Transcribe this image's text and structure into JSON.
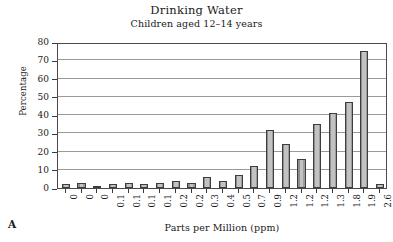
{
  "panel": {
    "label": "A"
  },
  "chart_data": {
    "type": "bar",
    "title": "Drinking Water",
    "subtitle": "Children aged 12–14 years",
    "xlabel": "Parts per Million (ppm)",
    "ylabel": "Percentage",
    "ylim": [
      0,
      80
    ],
    "yticks": [
      0,
      10,
      20,
      30,
      40,
      50,
      60,
      70,
      80
    ],
    "grid": true,
    "legend": "none",
    "categories": [
      "0",
      "0",
      "0",
      "0.1",
      "0.1",
      "0.1",
      "0.1",
      "0.2",
      "0.2",
      "0.3",
      "0.4",
      "0.5",
      "0.7",
      "0.9",
      "1.2",
      "1.2",
      "1.2",
      "1.3",
      "1.8",
      "1.9",
      "2.6"
    ],
    "values": [
      2,
      3,
      1,
      2,
      3,
      2,
      3,
      4,
      3,
      6,
      4,
      7,
      12,
      32,
      24,
      16,
      35,
      41,
      47,
      75,
      2
    ],
    "bar_color": "#b5b5b5",
    "bar_edge_color": "#3d3d3d",
    "grid_color": "#9a9a9a",
    "axis_color": "#4a4a4a",
    "background": "#ffffff"
  }
}
